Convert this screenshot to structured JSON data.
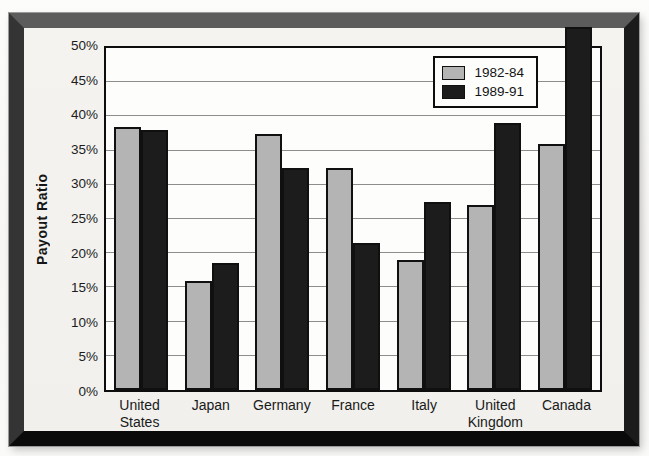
{
  "chart_data": {
    "type": "bar",
    "title": "",
    "xlabel": "",
    "ylabel": "Payout Ratio",
    "ylim": [
      0,
      50
    ],
    "ytick_step": 5,
    "ytick_labels": [
      "0%",
      "5%",
      "10%",
      "15%",
      "20%",
      "25%",
      "30%",
      "35%",
      "40%",
      "45%",
      "50%"
    ],
    "grid": "horizontal",
    "legend_position": "top-right",
    "categories": [
      "United\nStates",
      "Japan",
      "Germany",
      "France",
      "Italy",
      "United\nKingdom",
      "Canada"
    ],
    "series": [
      {
        "name": "1982-84",
        "color": "#b4b4b4",
        "values": [
          38.5,
          16,
          37.5,
          32.5,
          19,
          27,
          36
        ]
      },
      {
        "name": "1989-91",
        "color": "#1c1c1c",
        "values": [
          38,
          18.5,
          32.5,
          21.5,
          27.5,
          39,
          53
        ]
      }
    ],
    "annotations": "Canada 1989-91 bar exceeds the 50% axis maximum and overflows the top of the plot frame"
  },
  "colors": {
    "frame": "#1b1b1b",
    "paper": "#f2f1ee",
    "plot_background": "#fdfdfc",
    "gridline": "#8d8d8d",
    "bar_outline": "#101010",
    "series_1982_84": "#b4b4b4",
    "series_1989_91": "#1c1c1c"
  }
}
